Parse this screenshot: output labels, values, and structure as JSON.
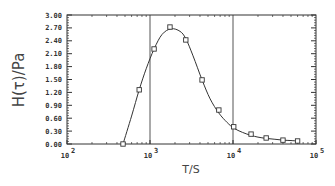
{
  "chart_data": {
    "type": "scatter",
    "title": "",
    "xlabel": "T/S",
    "ylabel": "H(τ)/Pa",
    "xscale": "log",
    "xlim": [
      100,
      100000
    ],
    "ylim": [
      0.0,
      3.0
    ],
    "x_ticks": [
      {
        "base": "10",
        "exp": "2",
        "value": 100
      },
      {
        "base": "10",
        "exp": "3",
        "value": 1000
      },
      {
        "base": "10",
        "exp": "4",
        "value": 10000
      },
      {
        "base": "10",
        "exp": "5",
        "value": 100000
      }
    ],
    "y_ticks": [
      "0.00",
      "0.30",
      "0.60",
      "0.90",
      "1.20",
      "1.50",
      "1.80",
      "2.10",
      "2.40",
      "2.70",
      "3.00"
    ],
    "reference_lines_x": [
      1000,
      10000
    ],
    "grid": false,
    "legend": null,
    "series": [
      {
        "name": "measured",
        "marker": "open-square",
        "x": [
          473,
          741,
          1120,
          1740,
          2700,
          4240,
          6750,
          10200,
          16500,
          25100,
          40000,
          60000
        ],
        "y": [
          0.0,
          1.26,
          2.21,
          2.72,
          2.42,
          1.49,
          0.79,
          0.4,
          0.23,
          0.14,
          0.09,
          0.07
        ]
      },
      {
        "name": "fit",
        "style": "line",
        "x": [
          473,
          600,
          741,
          900,
          1120,
          1400,
          1800,
          2300,
          2700,
          3300,
          4240,
          5300,
          6750,
          8500,
          10200,
          13000,
          16500,
          20000,
          25100,
          32000,
          40000,
          50000,
          60000
        ],
        "y": [
          0.0,
          0.65,
          1.26,
          1.75,
          2.21,
          2.55,
          2.68,
          2.62,
          2.45,
          2.05,
          1.49,
          1.05,
          0.72,
          0.5,
          0.37,
          0.27,
          0.2,
          0.16,
          0.13,
          0.11,
          0.09,
          0.08,
          0.07
        ]
      }
    ]
  }
}
